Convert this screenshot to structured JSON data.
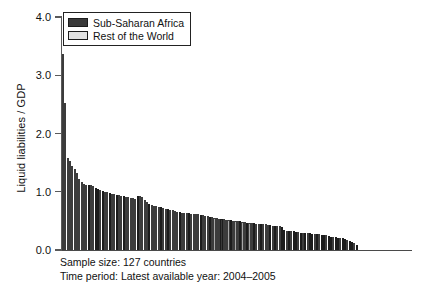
{
  "chart_data": {
    "type": "bar",
    "title": "",
    "xlabel": "",
    "ylabel": "Liquid liabilities / GDP",
    "ylim": [
      0.0,
      4.0
    ],
    "ytick_labels": [
      "4.0",
      "3.0",
      "2.0",
      "1.0",
      "0.0"
    ],
    "ytick_values": [
      4.0,
      3.0,
      2.0,
      1.0,
      0.0
    ],
    "grid": false,
    "legend_position": "top-left",
    "sorted": "descending",
    "n_bars": 127,
    "series": [
      {
        "name": "Sub-Saharan Africa",
        "color": "#3a3a3a"
      },
      {
        "name": "Rest of the World",
        "color": "#e2e2e2"
      }
    ],
    "categories": [
      "1",
      "2",
      "3",
      "4",
      "5",
      "6",
      "7",
      "8",
      "9",
      "10",
      "11",
      "12",
      "13",
      "14",
      "15",
      "16",
      "17",
      "18",
      "19",
      "20",
      "21",
      "22",
      "23",
      "24",
      "25",
      "26",
      "27",
      "28",
      "29",
      "30",
      "31",
      "32",
      "33",
      "34",
      "35",
      "36",
      "37",
      "38",
      "39",
      "40",
      "41",
      "42",
      "43",
      "44",
      "45",
      "46",
      "47",
      "48",
      "49",
      "50",
      "51",
      "52",
      "53",
      "54",
      "55",
      "56",
      "57",
      "58",
      "59",
      "60",
      "61",
      "62",
      "63",
      "64",
      "65",
      "66",
      "67",
      "68",
      "69",
      "70",
      "71",
      "72",
      "73",
      "74",
      "75",
      "76",
      "77",
      "78",
      "79",
      "80",
      "81",
      "82",
      "83",
      "84",
      "85",
      "86",
      "87",
      "88",
      "89",
      "90",
      "91",
      "92",
      "93",
      "94",
      "95",
      "96",
      "97",
      "98",
      "99",
      "100",
      "101",
      "102",
      "103",
      "104",
      "105",
      "106",
      "107",
      "108",
      "109",
      "110",
      "111",
      "112",
      "113",
      "114",
      "115",
      "116",
      "117",
      "118",
      "119",
      "120",
      "121",
      "122",
      "123",
      "124",
      "125",
      "126",
      "127"
    ],
    "values": [
      3.36,
      2.52,
      1.58,
      1.52,
      1.44,
      1.39,
      1.32,
      1.22,
      1.16,
      1.13,
      1.12,
      1.12,
      1.11,
      1.1,
      1.06,
      1.04,
      1.03,
      1.02,
      1.0,
      0.99,
      0.98,
      0.97,
      0.96,
      0.95,
      0.94,
      0.93,
      0.92,
      0.91,
      0.91,
      0.9,
      0.89,
      0.88,
      0.92,
      0.92,
      0.91,
      0.86,
      0.82,
      0.79,
      0.77,
      0.76,
      0.75,
      0.74,
      0.73,
      0.72,
      0.71,
      0.7,
      0.69,
      0.68,
      0.67,
      0.66,
      0.65,
      0.64,
      0.64,
      0.63,
      0.63,
      0.62,
      0.62,
      0.61,
      0.61,
      0.6,
      0.6,
      0.59,
      0.58,
      0.57,
      0.56,
      0.55,
      0.55,
      0.54,
      0.53,
      0.53,
      0.52,
      0.51,
      0.51,
      0.5,
      0.5,
      0.49,
      0.49,
      0.48,
      0.48,
      0.47,
      0.47,
      0.46,
      0.46,
      0.45,
      0.45,
      0.44,
      0.44,
      0.44,
      0.43,
      0.43,
      0.42,
      0.42,
      0.41,
      0.41,
      0.4,
      0.34,
      0.33,
      0.33,
      0.32,
      0.32,
      0.31,
      0.31,
      0.3,
      0.3,
      0.29,
      0.29,
      0.29,
      0.28,
      0.28,
      0.27,
      0.27,
      0.26,
      0.26,
      0.25,
      0.24,
      0.23,
      0.23,
      0.22,
      0.21,
      0.2,
      0.2,
      0.19,
      0.18,
      0.16,
      0.14,
      0.12,
      0.08
    ],
    "group_flags": [
      0,
      0,
      0,
      0,
      0,
      0,
      0,
      0,
      0,
      0,
      0,
      1,
      0,
      0,
      1,
      1,
      0,
      1,
      0,
      0,
      1,
      0,
      0,
      1,
      0,
      0,
      1,
      0,
      0,
      0,
      0,
      0,
      1,
      0,
      0,
      0,
      0,
      1,
      0,
      0,
      0,
      0,
      1,
      0,
      0,
      1,
      0,
      0,
      0,
      0,
      1,
      0,
      0,
      0,
      1,
      0,
      0,
      0,
      0,
      1,
      0,
      0,
      0,
      1,
      0,
      0,
      0,
      0,
      1,
      0,
      0,
      0,
      1,
      0,
      0,
      0,
      1,
      0,
      0,
      1,
      0,
      0,
      1,
      0,
      0,
      1,
      0,
      0,
      0,
      1,
      0,
      1,
      0,
      0,
      1,
      1,
      0,
      1,
      0,
      1,
      1,
      0,
      1,
      0,
      1,
      0,
      1,
      1,
      0,
      1,
      0,
      1,
      1,
      0,
      1,
      1,
      0,
      1,
      1,
      0,
      1,
      1,
      0,
      1,
      1,
      0,
      1
    ]
  },
  "legend": {
    "items": [
      {
        "label": "Sub-Saharan Africa",
        "swatch": "ssa"
      },
      {
        "label": "Rest of the World",
        "swatch": "row"
      }
    ]
  },
  "caption": {
    "line1": "Sample size: 127 countries",
    "line2": "Time period: Latest available year: 2004–2005"
  }
}
